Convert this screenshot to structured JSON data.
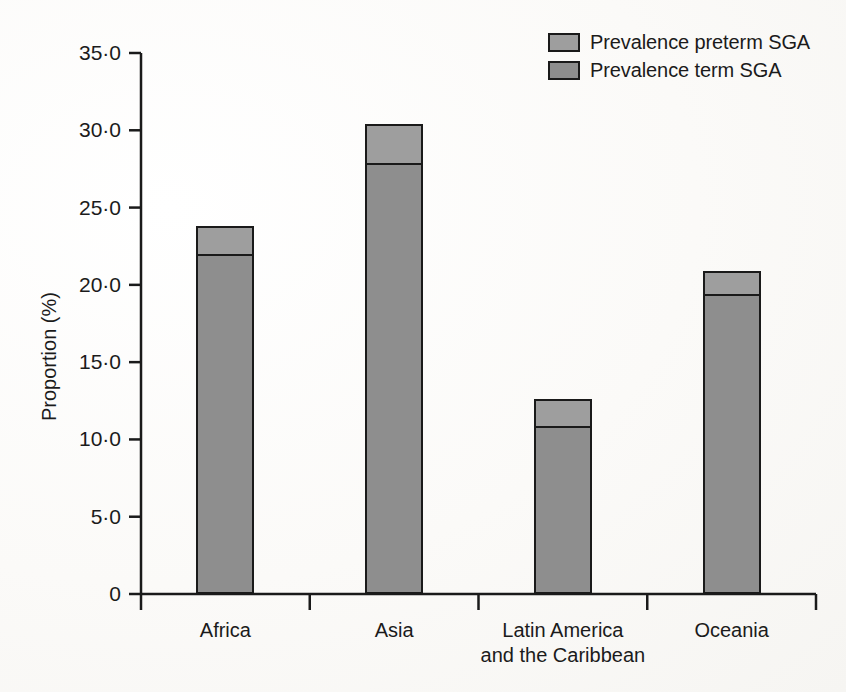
{
  "figure": {
    "background_color": "#fbfaf8",
    "axis_color": "#1a1a1a"
  },
  "legend": {
    "position": "top-right",
    "items": [
      {
        "label": "Prevalence preterm SGA",
        "color": "#9e9e9e",
        "series_key": "preterm"
      },
      {
        "label": "Prevalence term SGA",
        "color": "#8e8e8e",
        "series_key": "term"
      }
    ]
  },
  "chart_data": {
    "type": "bar",
    "subtype": "stacked",
    "title": "",
    "subtitle": "",
    "xlabel": "",
    "ylabel": "Proportion (%)",
    "ylim": [
      0,
      35
    ],
    "grid": false,
    "legend_position": "top-right",
    "categories": [
      "Africa",
      "Asia",
      "Latin America and the Caribbean",
      "Oceania"
    ],
    "category_lines": [
      [
        "Africa"
      ],
      [
        "Asia"
      ],
      [
        "Latin America",
        "and the Caribbean"
      ],
      [
        "Oceania"
      ]
    ],
    "ytick_values": [
      0,
      5,
      10,
      15,
      20,
      25,
      30,
      35
    ],
    "ytick_labels": [
      "0",
      "5·0",
      "10·0",
      "15·0",
      "20·0",
      "25·0",
      "30·0",
      "35·0"
    ],
    "series": [
      {
        "name": "Prevalence term SGA",
        "key": "term",
        "color": "#8e8e8e",
        "values": [
          22.0,
          27.9,
          10.9,
          19.4
        ]
      },
      {
        "name": "Prevalence preterm SGA",
        "key": "preterm",
        "color": "#9e9e9e",
        "values": [
          1.8,
          2.5,
          1.7,
          1.5
        ]
      }
    ],
    "totals": [
      23.8,
      30.4,
      12.6,
      20.9
    ]
  }
}
